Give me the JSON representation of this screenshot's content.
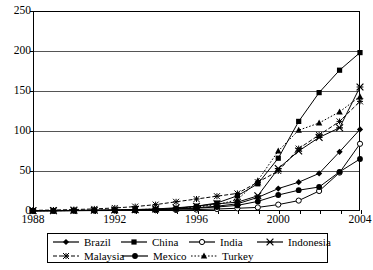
{
  "chart_data": {
    "type": "line",
    "title": "",
    "xlabel": "",
    "ylabel": "",
    "x": [
      1988,
      1989,
      1990,
      1991,
      1992,
      1993,
      1994,
      1995,
      1996,
      1997,
      1998,
      1999,
      2000,
      2001,
      2002,
      2003,
      2004
    ],
    "xlim": [
      1988,
      2004
    ],
    "ylim": [
      0,
      250
    ],
    "ytick_labels": [
      "0",
      "50",
      "100",
      "150",
      "200",
      "250"
    ],
    "yticks": [
      0,
      50,
      100,
      150,
      200,
      250
    ],
    "xtick_labels": [
      "1988",
      "1992",
      "1996",
      "2000",
      "2004"
    ],
    "xticks": [
      1988,
      1992,
      1996,
      2000,
      2004
    ],
    "grid": "horizontal",
    "legend_position": "bottom",
    "series": [
      {
        "name": "Brazil",
        "marker": "diamond",
        "line_style": "solid",
        "color": "#000000",
        "values": [
          0.4,
          0.6,
          0.8,
          0.9,
          1.1,
          1.5,
          2.0,
          2.6,
          4.0,
          6.0,
          9.0,
          17.0,
          28.0,
          36.0,
          47.0,
          74.0,
          102.0
        ]
      },
      {
        "name": "China",
        "marker": "square",
        "line_style": "solid",
        "color": "#000000",
        "values": [
          0.3,
          0.4,
          0.6,
          0.8,
          1.0,
          1.4,
          2.0,
          3.2,
          6.0,
          10.0,
          19.0,
          34.0,
          66.0,
          112.0,
          148.0,
          176.0,
          198.0
        ]
      },
      {
        "name": "India",
        "marker": "circle-open",
        "line_style": "solid",
        "color": "#000000",
        "values": [
          0.2,
          0.3,
          0.4,
          0.5,
          0.6,
          0.8,
          1.0,
          1.3,
          1.8,
          2.5,
          3.4,
          4.5,
          8.0,
          13.0,
          25.0,
          48.0,
          84.0
        ]
      },
      {
        "name": "Indonesia",
        "marker": "x-star",
        "line_style": "solid",
        "color": "#000000",
        "values": [
          0.3,
          0.4,
          0.6,
          0.9,
          1.2,
          1.8,
          2.6,
          4.0,
          6.0,
          9.0,
          11.0,
          19.0,
          53.0,
          75.0,
          92.0,
          104.0,
          155.0
        ]
      },
      {
        "name": "Malaysia",
        "marker": "star-small",
        "line_style": "dashed",
        "color": "#000000",
        "values": [
          0.8,
          1.2,
          1.8,
          2.6,
          3.8,
          5.5,
          8.0,
          11.5,
          15.0,
          18.5,
          22.0,
          36.0,
          50.0,
          78.0,
          95.0,
          112.0,
          137.0
        ]
      },
      {
        "name": "Mexico",
        "marker": "circle-filled",
        "line_style": "solid",
        "color": "#000000",
        "values": [
          0.3,
          0.4,
          0.5,
          0.7,
          0.9,
          1.2,
          1.7,
          2.4,
          3.5,
          5.0,
          7.0,
          12.0,
          20.0,
          26.0,
          30.0,
          49.0,
          65.0
        ]
      },
      {
        "name": "Turkey",
        "marker": "triangle",
        "line_style": "dotted",
        "color": "#000000",
        "values": [
          0.3,
          0.4,
          0.6,
          0.8,
          1.2,
          1.7,
          2.4,
          3.4,
          5.0,
          8.0,
          14.0,
          38.0,
          75.0,
          101.0,
          110.0,
          124.0,
          143.0
        ]
      }
    ]
  },
  "legend": {
    "rows": [
      [
        "Brazil",
        "China",
        "India",
        "Indonesia"
      ],
      [
        "Malaysia",
        "Mexico",
        "Turkey"
      ]
    ]
  }
}
